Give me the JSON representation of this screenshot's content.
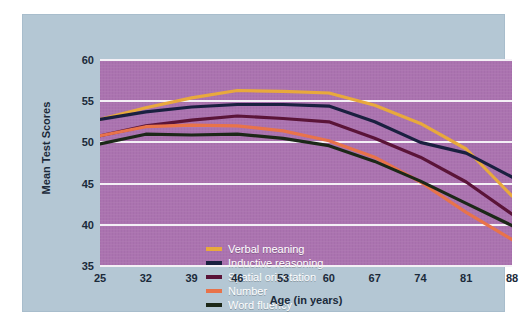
{
  "chart_data": {
    "type": "line",
    "title": "",
    "xlabel": "Age (in years)",
    "ylabel": "Mean Test Scores",
    "x": [
      25,
      32,
      39,
      46,
      53,
      60,
      67,
      74,
      81,
      88
    ],
    "xtick_labels": [
      "25",
      "32",
      "39",
      "46",
      "53",
      "60",
      "67",
      "74",
      "81",
      "88"
    ],
    "ytick_labels": [
      "35",
      "40",
      "45",
      "50",
      "55",
      "60"
    ],
    "yticks": [
      35,
      40,
      45,
      50,
      55,
      60
    ],
    "ylim": [
      35,
      60
    ],
    "xlim": [
      25,
      88
    ],
    "grid": "horizontal",
    "legend_position": "inside-lower-left",
    "plot_background": "#ab73b0",
    "figure_background": "#b4c7d4",
    "gridline_color": "#f4f0f6",
    "series": [
      {
        "name": "Verbal meaning",
        "color": "#e8a93c",
        "values": [
          52.8,
          54.2,
          55.4,
          56.3,
          56.2,
          56.0,
          54.5,
          52.3,
          49.2,
          43.5
        ]
      },
      {
        "name": "Inductive reasoning",
        "color": "#1a2040",
        "values": [
          52.8,
          53.7,
          54.3,
          54.6,
          54.6,
          54.4,
          52.5,
          50.0,
          48.7,
          45.8
        ]
      },
      {
        "name": "Spatial orientation",
        "color": "#5a1438",
        "values": [
          50.8,
          52.0,
          52.7,
          53.2,
          52.9,
          52.5,
          50.5,
          48.2,
          45.2,
          41.3
        ]
      },
      {
        "name": "Number",
        "color": "#e8734a",
        "values": [
          50.8,
          51.9,
          52.1,
          52.0,
          51.4,
          50.2,
          48.2,
          45.2,
          41.5,
          38.2
        ]
      },
      {
        "name": "Word fluency",
        "color": "#1c2818",
        "values": [
          49.8,
          51.0,
          50.9,
          51.0,
          50.5,
          49.6,
          47.7,
          45.3,
          42.6,
          39.9
        ]
      }
    ]
  }
}
